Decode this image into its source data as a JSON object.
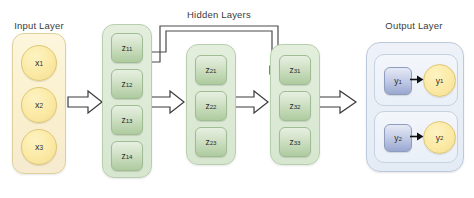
{
  "diagram": {
    "background": "#ffffff",
    "width": 474,
    "height": 198
  },
  "labels": {
    "input": "Input Layer",
    "hidden": "Hidden Layers",
    "output": "Output Layer"
  },
  "colors": {
    "input_panel": "#faf0cd",
    "input_node": "#fbe9a4",
    "hidden_panel": "#dcead5",
    "hidden_node": "#cfe0c4",
    "output_panel": "#e8eef6",
    "output_square": "#c3cce6",
    "output_circle": "#fbe9a4",
    "arrow_stroke": "#3a3a3a",
    "arrow_fill": "#ffffff",
    "bracket_stroke": "#4a4a4a",
    "text": "#3b3b3b"
  },
  "input_layer": {
    "name": "Input Layer",
    "nodes": [
      {
        "base": "x",
        "sub": "1",
        "text": "x1"
      },
      {
        "base": "x",
        "sub": "2",
        "text": "x2"
      },
      {
        "base": "x",
        "sub": "3",
        "text": "x3"
      }
    ]
  },
  "hidden_layers": [
    {
      "index": 1,
      "node_count": 4,
      "nodes": [
        {
          "base": "z",
          "sub": "11",
          "text": "z11"
        },
        {
          "base": "z",
          "sub": "12",
          "text": "z12"
        },
        {
          "base": "z",
          "sub": "13",
          "text": "z13"
        },
        {
          "base": "z",
          "sub": "14",
          "text": "z14"
        }
      ]
    },
    {
      "index": 2,
      "node_count": 3,
      "nodes": [
        {
          "base": "z",
          "sub": "21",
          "text": "z21"
        },
        {
          "base": "z",
          "sub": "22",
          "text": "z22"
        },
        {
          "base": "z",
          "sub": "23",
          "text": "z23"
        }
      ]
    },
    {
      "index": 3,
      "node_count": 3,
      "nodes": [
        {
          "base": "z",
          "sub": "31",
          "text": "z31"
        },
        {
          "base": "z",
          "sub": "32",
          "text": "z32"
        },
        {
          "base": "z",
          "sub": "33",
          "text": "z33"
        }
      ]
    }
  ],
  "output_layer": {
    "name": "Output Layer",
    "units": [
      {
        "square": {
          "base": "y",
          "sub": "1",
          "text": "y1"
        },
        "circle": {
          "base": "y",
          "sub": "1",
          "text": "y1"
        }
      },
      {
        "square": {
          "base": "y",
          "sub": "2",
          "text": "y2"
        },
        "circle": {
          "base": "y",
          "sub": "2",
          "text": "y2"
        }
      }
    ]
  },
  "connections": {
    "block_arrows": [
      {
        "from": "input_layer",
        "to": "hidden_layer_1"
      },
      {
        "from": "hidden_layer_1",
        "to": "hidden_layer_2"
      },
      {
        "from": "hidden_layer_2",
        "to": "hidden_layer_3"
      },
      {
        "from": "hidden_layer_1_skip",
        "to": "hidden_layer_3"
      },
      {
        "from": "hidden_layer_3",
        "to": "output_layer"
      }
    ],
    "skip_brackets": 2
  }
}
